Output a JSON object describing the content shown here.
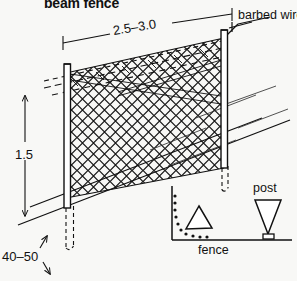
{
  "figure": {
    "title": "beam fence",
    "type": "technical-line-drawing"
  },
  "labels": {
    "barbed_wire": "barbed wire",
    "post_spacing": "2.5–3.0",
    "fence_height": "1.5",
    "foundation_depth": "40–50",
    "inset_post": "post",
    "inset_fence": "fence"
  },
  "dimensions": [
    {
      "name": "post-spacing",
      "value": "2.5–3.0",
      "orientation": "horizontal",
      "location": "top"
    },
    {
      "name": "fence-height",
      "value": "1.5",
      "orientation": "vertical",
      "location": "left"
    },
    {
      "name": "foundation-depth",
      "value": "40–50",
      "orientation": "vertical",
      "location": "bottom-left"
    }
  ],
  "components": [
    {
      "name": "left-post",
      "kind": "post"
    },
    {
      "name": "right-post",
      "kind": "post"
    },
    {
      "name": "chain-link-mesh",
      "kind": "mesh"
    },
    {
      "name": "barbed-wire-strands",
      "kind": "wire",
      "count": 3
    },
    {
      "name": "ground-line",
      "kind": "terrain"
    },
    {
      "name": "post-footing",
      "kind": "foundation"
    }
  ],
  "inset": {
    "name": "plan-detail",
    "shapes": [
      "up-triangle",
      "down-triangle",
      "corner-bead-line",
      "baseline"
    ],
    "labels": [
      "post",
      "fence"
    ]
  },
  "colors": {
    "background": "#f8f8f6",
    "ink": "#111111",
    "mesh": "#222222"
  }
}
